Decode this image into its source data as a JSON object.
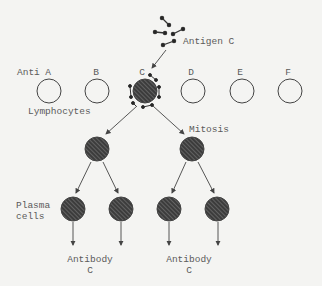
{
  "antigen": {
    "label": "Antigen C"
  },
  "lymphocytes": {
    "prefix": "Anti",
    "row_label": "Lymphocytes",
    "cells": [
      {
        "letter": "A",
        "selected": false
      },
      {
        "letter": "B",
        "selected": false
      },
      {
        "letter": "C",
        "selected": true
      },
      {
        "letter": "D",
        "selected": false
      },
      {
        "letter": "E",
        "selected": false
      },
      {
        "letter": "F",
        "selected": false
      }
    ]
  },
  "mitosis": {
    "label": "Mitosis"
  },
  "plasma": {
    "label_line1": "Plasma",
    "label_line2": "cells"
  },
  "antibodies": [
    {
      "line1": "Antibody",
      "line2": "C"
    },
    {
      "line1": "Antibody",
      "line2": "C"
    }
  ],
  "colors": {
    "line": "#444444",
    "cell_fill": "#3a3a3a",
    "background": "#f4f4f2"
  }
}
